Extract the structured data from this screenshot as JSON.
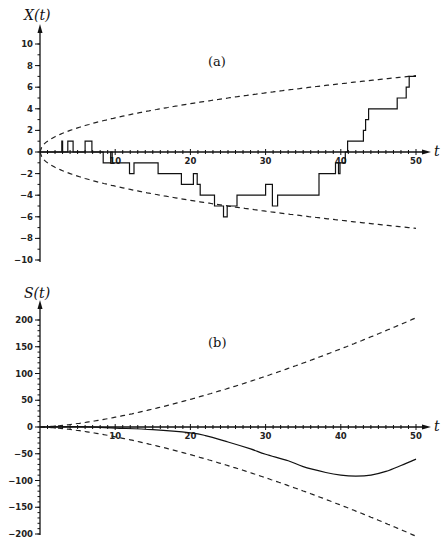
{
  "chart_data": [
    {
      "type": "line",
      "panel_label": "(a)",
      "ylabel": "X(t)",
      "xlabel": "t",
      "xlim": [
        0,
        50
      ],
      "ylim": [
        -10,
        10
      ],
      "x_tick_labels": [
        "10",
        "20",
        "30",
        "40",
        "50"
      ],
      "y_tick_labels": [
        "10",
        "8",
        "6",
        "4",
        "2",
        "0",
        "−2",
        "−4",
        "−6",
        "−8",
        "−10"
      ],
      "grid": false,
      "series": [
        {
          "name": "X(t) random walk (step)",
          "style": "solid-step",
          "points": [
            [
              0,
              0
            ],
            [
              2.9,
              1
            ],
            [
              3.0,
              0
            ],
            [
              3.7,
              1
            ],
            [
              4.4,
              0
            ],
            [
              6.0,
              1
            ],
            [
              6.9,
              0
            ],
            [
              8.4,
              -1
            ],
            [
              9.4,
              0
            ],
            [
              9.6,
              -1
            ],
            [
              11.9,
              -2
            ],
            [
              12.5,
              -1
            ],
            [
              15.7,
              -2
            ],
            [
              18.8,
              -3
            ],
            [
              20.4,
              -2
            ],
            [
              20.9,
              -3
            ],
            [
              21.3,
              -4
            ],
            [
              23.2,
              -5
            ],
            [
              24.4,
              -6
            ],
            [
              24.9,
              -5
            ],
            [
              26.2,
              -4
            ],
            [
              30.0,
              -3
            ],
            [
              30.9,
              -5
            ],
            [
              31.6,
              -4
            ],
            [
              37.1,
              -2
            ],
            [
              39.3,
              -1
            ],
            [
              39.7,
              -2
            ],
            [
              39.9,
              -1
            ],
            [
              40.6,
              0
            ],
            [
              40.9,
              1
            ],
            [
              43.0,
              2
            ],
            [
              43.3,
              3
            ],
            [
              43.7,
              4
            ],
            [
              47.5,
              5
            ],
            [
              48.7,
              6
            ],
            [
              49.1,
              7
            ],
            [
              50,
              7
            ]
          ]
        },
        {
          "name": "upper bound +sqrt(t)",
          "style": "dashed",
          "formula": "+t^0.5"
        },
        {
          "name": "lower bound -sqrt(t)",
          "style": "dashed",
          "formula": "-t^0.5"
        }
      ]
    },
    {
      "type": "line",
      "panel_label": "(b)",
      "ylabel": "S(t)",
      "xlabel": "t",
      "xlim": [
        0,
        50
      ],
      "ylim": [
        -200,
        200
      ],
      "x_tick_labels": [
        "10",
        "20",
        "30",
        "40",
        "50"
      ],
      "y_tick_labels": [
        "200",
        "150",
        "100",
        "50",
        "0",
        "−50",
        "−100",
        "−150",
        "−200"
      ],
      "grid": false,
      "series": [
        {
          "name": "S(t) integrated walk",
          "style": "solid",
          "points": [
            [
              0,
              0
            ],
            [
              5,
              0.5
            ],
            [
              10,
              -2
            ],
            [
              15,
              -5
            ],
            [
              20,
              -11
            ],
            [
              22,
              -16
            ],
            [
              25,
              -28
            ],
            [
              28,
              -41
            ],
            [
              30,
              -51
            ],
            [
              33,
              -63
            ],
            [
              35,
              -74
            ],
            [
              38,
              -85
            ],
            [
              40,
              -90
            ],
            [
              42,
              -92
            ],
            [
              44,
              -90
            ],
            [
              46,
              -83
            ],
            [
              48,
              -72
            ],
            [
              50,
              -60
            ]
          ]
        },
        {
          "name": "upper bound +t^1.5/sqrt(3)",
          "style": "dashed",
          "formula": "+t^1.5/1.732"
        },
        {
          "name": "lower bound -t^1.5/sqrt(3)",
          "style": "dashed",
          "formula": "-t^1.5/1.732"
        }
      ]
    }
  ]
}
